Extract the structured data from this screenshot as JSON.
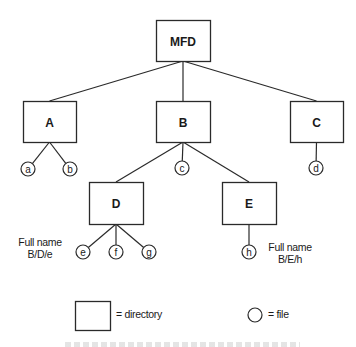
{
  "diagram": {
    "type": "directory-tree",
    "root": "MFD",
    "directories": [
      {
        "id": "MFD",
        "label": "MFD",
        "x": 156,
        "y": 20,
        "w": 54,
        "h": 41
      },
      {
        "id": "A",
        "label": "A",
        "x": 23,
        "y": 101,
        "w": 53,
        "h": 41
      },
      {
        "id": "B",
        "label": "B",
        "x": 156,
        "y": 101,
        "w": 54,
        "h": 41
      },
      {
        "id": "C",
        "label": "C",
        "x": 290,
        "y": 101,
        "w": 53,
        "h": 41
      },
      {
        "id": "D",
        "label": "D",
        "x": 89,
        "y": 182,
        "w": 54,
        "h": 42
      },
      {
        "id": "E",
        "label": "E",
        "x": 222,
        "y": 182,
        "w": 54,
        "h": 42
      }
    ],
    "files": [
      {
        "id": "a",
        "label": "a",
        "parent": "A",
        "cx": 28,
        "cy": 169
      },
      {
        "id": "b",
        "label": "b",
        "parent": "A",
        "cx": 70,
        "cy": 169
      },
      {
        "id": "c",
        "label": "c",
        "parent": "B",
        "cx": 182,
        "cy": 168
      },
      {
        "id": "d",
        "label": "d",
        "parent": "C",
        "cx": 316,
        "cy": 168
      },
      {
        "id": "e",
        "label": "e",
        "parent": "D",
        "cx": 83,
        "cy": 252
      },
      {
        "id": "f",
        "label": "f",
        "parent": "D",
        "cx": 116,
        "cy": 252
      },
      {
        "id": "g",
        "label": "g",
        "parent": "D",
        "cx": 149,
        "cy": 252
      },
      {
        "id": "h",
        "label": "h",
        "parent": "E",
        "cx": 249,
        "cy": 252
      }
    ],
    "edges": [
      [
        "MFD",
        "A"
      ],
      [
        "MFD",
        "B"
      ],
      [
        "MFD",
        "C"
      ],
      [
        "A",
        "a"
      ],
      [
        "A",
        "b"
      ],
      [
        "B",
        "D"
      ],
      [
        "B",
        "c"
      ],
      [
        "B",
        "E"
      ],
      [
        "C",
        "d"
      ],
      [
        "D",
        "e"
      ],
      [
        "D",
        "f"
      ],
      [
        "D",
        "g"
      ],
      [
        "E",
        "h"
      ]
    ]
  },
  "annotations": {
    "left_fullname": {
      "line1": "Full name",
      "line2": "B/D/e"
    },
    "right_fullname": {
      "line1": "Full name",
      "line2": "B/E/h"
    }
  },
  "legend": {
    "directory_label": "= directory",
    "file_label": "= file"
  }
}
